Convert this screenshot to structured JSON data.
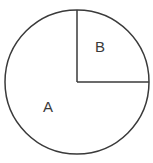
{
  "figure": {
    "kind": "circle-sector-diagram",
    "background_color": "#ffffff",
    "stroke_color": "#3a3a3a",
    "stroke_width": 1.5,
    "text_color": "#3a3a3a",
    "circle": {
      "center_x": 77,
      "center_y": 82,
      "radius": 73
    },
    "radii": [
      {
        "name": "vertical-radius",
        "from_x": 77,
        "from_y": 82,
        "to_x": 77,
        "to_y": 9,
        "direction": "up"
      },
      {
        "name": "horizontal-radius",
        "from_x": 77,
        "from_y": 82,
        "to_x": 150,
        "to_y": 82,
        "direction": "right"
      }
    ],
    "regions": [
      {
        "id": "A",
        "label": "A",
        "description": "major sector, three quarters of the circle",
        "label_x": 48,
        "label_y": 112
      },
      {
        "id": "B",
        "label": "B",
        "description": "minor sector, upper right quarter of the circle",
        "label_x": 100,
        "label_y": 52
      }
    ]
  }
}
